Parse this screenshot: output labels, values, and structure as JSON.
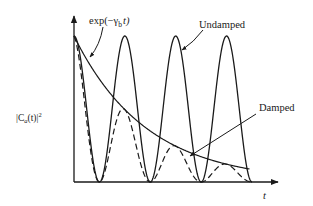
{
  "chart_data": {
    "type": "line",
    "title": "",
    "xlabel": "t",
    "ylabel": "|C_a(t)|²",
    "grid": false,
    "legend": "annotations with leader arrows",
    "x_range": [
      0,
      3.5
    ],
    "y_range": [
      0,
      1
    ],
    "x_units": "half-periods of Rabi oscillation",
    "series": [
      {
        "name": "Undamped",
        "style": "solid",
        "formula": "cos^2(pi * x)",
        "x": [
          0,
          0.5,
          1,
          1.5,
          2,
          2.5,
          3,
          3.5
        ],
        "values": [
          1,
          0,
          1,
          0,
          1,
          0,
          1,
          0
        ]
      },
      {
        "name": "Damped",
        "style": "dashed",
        "formula": "exp(-gamma_b t) * cos^2(pi * x)",
        "x": [
          0,
          0.5,
          0.95,
          1.5,
          1.95,
          2.5,
          3.05,
          3.5
        ],
        "values": [
          1,
          0,
          0.51,
          0,
          0.25,
          0,
          0.12,
          0
        ]
      },
      {
        "name": "exp(−γ_b t)",
        "style": "solid",
        "formula": "exp(-gamma_b t)",
        "x": [
          0,
          0.5,
          1,
          1.5,
          2,
          2.5,
          3,
          3.45
        ],
        "values": [
          1,
          0.7,
          0.5,
          0.35,
          0.25,
          0.18,
          0.13,
          0.09
        ]
      }
    ],
    "annotations": [
      {
        "text": "exp(−γ_b t)",
        "points_to": "envelope curve"
      },
      {
        "text": "Undamped",
        "points_to": "undamped oscillation"
      },
      {
        "text": "Damped",
        "points_to": "damped oscillation"
      }
    ]
  },
  "labels": {
    "ylabel_main": "|C",
    "ylabel_sub": "a",
    "ylabel_tail": "(t)|",
    "ylabel_sup": "2",
    "xlabel": "t",
    "exp_main": "exp(−γ",
    "exp_sub": "b",
    "exp_tail": "t)",
    "undamped": "Undamped",
    "damped": "Damped"
  },
  "colors": {
    "ink": "#1a1a1a",
    "background": "#ffffff"
  }
}
